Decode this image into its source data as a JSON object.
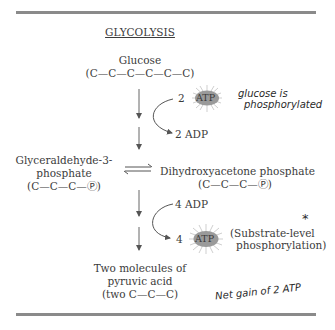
{
  "title": "GLYCOLYSIS",
  "glucose": {
    "name": "Glucose",
    "formula": "(C—C—C—C—C—C)"
  },
  "step1": {
    "atp_in": {
      "count": "2",
      "label": "ATP"
    },
    "adp_out": "2 ADP",
    "annotation_line1": "glucose is",
    "annotation_line2": "phosphorylated"
  },
  "g3p": {
    "line1": "Glyceraldehyde-3-",
    "line2": "phosphate",
    "formula": "(C—C—C—Ⓟ)"
  },
  "dhap": {
    "name": "Dihydroxyacetone phosphate",
    "formula": "(C—C—C—Ⓟ)"
  },
  "step2": {
    "adp_in": "4 ADP",
    "atp_out": {
      "count": "4",
      "label": "ATP"
    },
    "note_line1": "(Substrate-level",
    "note_line2": "phosphorylation)",
    "star_mark": "*"
  },
  "pyruvate": {
    "line1": "Two molecules of",
    "line2": "pyruvic acid",
    "line3": "(two C—C—C)"
  },
  "net_annotation": "Net gain of 2 ATP",
  "colors": {
    "rule": "#8a8a8a",
    "atp_fill": "#9a9a9a",
    "atp_rays": "#c8c8c8",
    "text": "#3b3b3b"
  }
}
